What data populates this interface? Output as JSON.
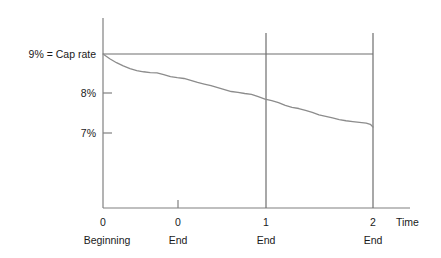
{
  "chart_data": {
    "type": "line",
    "title": "",
    "subtitle": "",
    "xlabel": "Time",
    "ylabel": "",
    "grid": false,
    "legend": null,
    "xlim": [
      0,
      2.35
    ],
    "ylim": [
      6.0,
      9.55
    ],
    "x_ticks": [
      {
        "value": 0.0,
        "label": "0",
        "sublabel": "Beginning"
      },
      {
        "value": 0.42,
        "label": "0",
        "sublabel": "End"
      },
      {
        "value": 1.0,
        "label": "1",
        "sublabel": "End"
      },
      {
        "value": 2.0,
        "label": "2",
        "sublabel": "End"
      }
    ],
    "y_ticks": [
      {
        "value": 9,
        "label": "9% = Cap rate"
      },
      {
        "value": 8,
        "label": "8%"
      },
      {
        "value": 7,
        "label": "7%"
      }
    ],
    "reference_lines": [
      {
        "name": "cap-rate-line",
        "orientation": "horizontal",
        "value": 9,
        "label": "9% = Cap rate",
        "x_from": 0.0,
        "x_to": 2.0
      },
      {
        "name": "year-one-end-line",
        "orientation": "vertical",
        "value": 1.0,
        "label": "End"
      },
      {
        "name": "year-two-end-line",
        "orientation": "vertical",
        "value": 2.0,
        "label": "End"
      }
    ],
    "series": [
      {
        "name": "Effective yield",
        "color": "#8c8c8c",
        "x": [
          0.0,
          0.05,
          0.1,
          0.15,
          0.2,
          0.25,
          0.3,
          0.35,
          0.4,
          0.45,
          0.5,
          0.55,
          0.6,
          0.65,
          0.7,
          0.75,
          0.8,
          0.85,
          0.9,
          0.95,
          1.0,
          1.05,
          1.1,
          1.15,
          1.2,
          1.25,
          1.3,
          1.35,
          1.4,
          1.45,
          1.5,
          1.55,
          1.6,
          1.65,
          1.7,
          1.75,
          1.8,
          1.85,
          1.9,
          1.95,
          1.98,
          2.0
        ],
        "y": [
          9.0,
          8.88,
          8.78,
          8.7,
          8.63,
          8.58,
          8.55,
          8.53,
          8.52,
          8.48,
          8.43,
          8.4,
          8.38,
          8.33,
          8.28,
          8.24,
          8.2,
          8.15,
          8.1,
          8.05,
          8.03,
          8.0,
          7.98,
          7.92,
          7.86,
          7.82,
          7.77,
          7.7,
          7.65,
          7.62,
          7.57,
          7.52,
          7.46,
          7.42,
          7.38,
          7.34,
          7.31,
          7.29,
          7.27,
          7.25,
          7.22,
          7.15
        ]
      }
    ]
  },
  "labels": {
    "cap_rate": "9% = Cap rate",
    "y_8": "8%",
    "y_7": "7%",
    "x_0_a": "0",
    "x_0_b": "0",
    "x_1": "1",
    "x_2": "2",
    "time": "Time",
    "beginning": "Beginning",
    "end_a": "End",
    "end_b": "End",
    "end_c": "End"
  },
  "colors": {
    "axis": "#808080",
    "curve": "#8c8c8c",
    "reference": "#6e6e6e",
    "text": "#1a1a1a",
    "background": "#ffffff"
  }
}
